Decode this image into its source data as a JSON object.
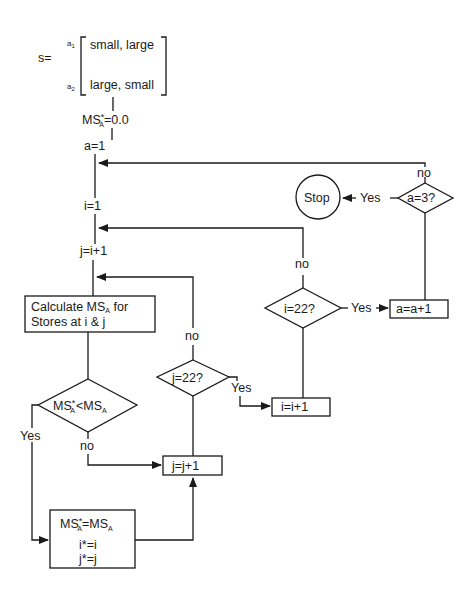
{
  "diagram": {
    "type": "flowchart",
    "matrix": {
      "label": "s=",
      "rows": [
        {
          "row_label": "a",
          "row_sub": "1",
          "value": "small, large"
        },
        {
          "row_label": "a",
          "row_sub": "2",
          "value": "large, small"
        }
      ]
    },
    "init_ms": {
      "lhs": "MS",
      "sup": "*",
      "sub": "A",
      "rhs": "=0.0"
    },
    "init_a": "a=1",
    "init_i": "i=1",
    "init_j": "j=i+1",
    "calc_box": {
      "line1_prefix": "Calculate MS",
      "line1_sub": "A",
      "line1_suffix": " for",
      "line2": "Stores at i & j"
    },
    "compare_diamond": {
      "lhs": "MS",
      "lhs_sup": "*",
      "lhs_sub": "A",
      "op": "<",
      "rhs": "MS",
      "rhs_sub": "A"
    },
    "compare_yes": "Yes",
    "compare_no": "no",
    "update_box": {
      "line1_lhs": "MS",
      "line1_sup": "*",
      "line1_sub": "A",
      "line1_rhs": "=MS",
      "line1_rhs_sub": "A",
      "line2": "i*=i",
      "line3": "j*=j"
    },
    "j_increment": "j=j+1",
    "j_check": "j=22?",
    "j_check_no": "no",
    "j_check_yes": "Yes",
    "i_increment": "i=i+1",
    "i_check": "i=22?",
    "i_check_no": "no",
    "i_check_yes": "Yes",
    "a_increment": "a=a+1",
    "a_check": "a=3?",
    "a_check_no": "no",
    "a_check_yes": "Yes",
    "stop": "Stop"
  }
}
